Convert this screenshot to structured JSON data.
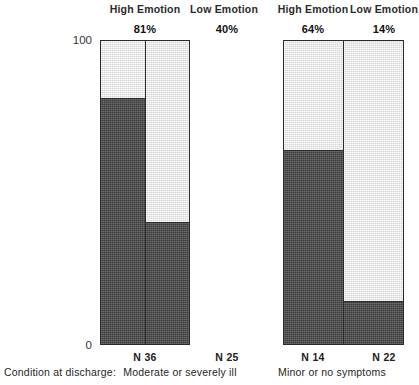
{
  "chart_data": {
    "type": "bar",
    "title": "",
    "subtitle": "",
    "xlabel": "",
    "ylabel": "Per cent Deteriorated",
    "ylim": [
      0,
      100
    ],
    "yticks": [
      "0",
      "100"
    ],
    "grid": false,
    "legend_position": "none",
    "stacked": true,
    "note": "Each bar is a 100% column; the dark lower segment encodes the labelled per cent deteriorated, the light upper segment the remainder.",
    "groups": [
      {
        "group_label": "Moderate or severely ill",
        "bars": [
          {
            "emotion": "High Emotion",
            "value": 81,
            "value_label": "81%",
            "n_label": "N 36",
            "n": 36
          },
          {
            "emotion": "Low Emotion",
            "value": 40,
            "value_label": "40%",
            "n_label": "N 25",
            "n": 25
          }
        ]
      },
      {
        "group_label": "Minor or no symptoms",
        "bars": [
          {
            "emotion": "High Emotion",
            "value": 64,
            "value_label": "64%",
            "n_label": "N 14",
            "n": 14
          },
          {
            "emotion": "Low Emotion",
            "value": 14,
            "value_label": "14%",
            "n_label": "N 22",
            "n": 22
          }
        ]
      }
    ],
    "categories": [
      "High Emotion / Moderate or severely ill",
      "Low Emotion / Moderate or severely ill",
      "High Emotion / Minor or no symptoms",
      "Low Emotion / Minor or no symptoms"
    ],
    "values": [
      81,
      40,
      64,
      14
    ]
  },
  "axis": {
    "y_title": "Per cent Deteriorated",
    "tick_top": "100",
    "tick_bottom": "0"
  },
  "headers": {
    "g1_high": "High Emotion",
    "g1_low": "Low Emotion",
    "g2_high": "High Emotion",
    "g2_low": "Low Emotion"
  },
  "percent_labels": {
    "b1": "81%",
    "b2": "40%",
    "b3": "64%",
    "b4": "14%"
  },
  "n_labels": {
    "b1": "N 36",
    "b2": "N 25",
    "b3": "N 14",
    "b4": "N 22"
  },
  "caption": {
    "prefix": "Condition at discharge:",
    "group1": "Moderate or severely ill",
    "group2": "Minor or no symptoms"
  },
  "colors": {
    "dark_segment": "#4c4c4c",
    "light_segment": "#e4e4e4",
    "outline": "#2a2a2a",
    "text": "#1a1a1a"
  }
}
